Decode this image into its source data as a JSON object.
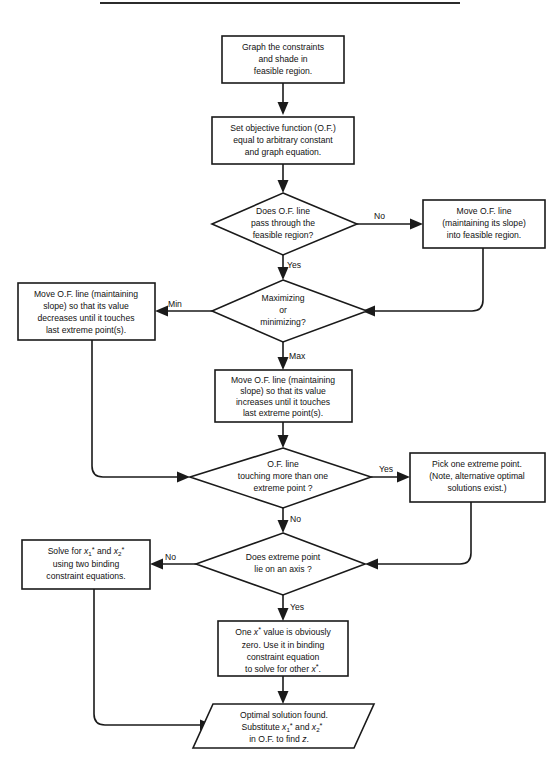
{
  "document": {
    "title": "Graphical Linear Programming Solution Procedure Flowchart",
    "top_rule_visible": true
  },
  "colors": {
    "stroke": "#1a1a1a",
    "text": "#111111",
    "background": "#ffffff",
    "rule": "#2b2b2b"
  },
  "nodes": [
    {
      "id": "graph-constraints",
      "shape": "process",
      "lines": [
        "Graph the constraints",
        "and shade in",
        "feasible region."
      ]
    },
    {
      "id": "set-objective-function",
      "shape": "process",
      "lines": [
        "Set objective function (O.F.)",
        "equal to arbitrary constant",
        "and graph equation."
      ]
    },
    {
      "id": "does-of-line-pass",
      "shape": "decision",
      "lines": [
        "Does  O.F. line",
        "pass through the",
        "feasible region?"
      ]
    },
    {
      "id": "move-of-line-into-feasible",
      "shape": "process",
      "lines": [
        "Move O.F. line",
        "(maintaining its slope)",
        "into feasible region."
      ]
    },
    {
      "id": "maximizing-or-minimizing",
      "shape": "decision",
      "lines": [
        "Maximizing",
        "or",
        "minimizing?"
      ]
    },
    {
      "id": "move-of-line-decreases",
      "shape": "process",
      "lines": [
        "Move O.F. line (maintaining",
        "slope) so that its value",
        "decreases until it touches",
        "last extreme point(s)."
      ]
    },
    {
      "id": "move-of-line-increases",
      "shape": "process",
      "lines": [
        "Move O.F. line (maintaining",
        "slope) so that its value",
        "increases  until it touches",
        "last extreme point(s)."
      ]
    },
    {
      "id": "touching-more-than-one",
      "shape": "decision",
      "lines": [
        "O.F. line",
        "touching more than one",
        "extreme point ?"
      ]
    },
    {
      "id": "pick-one-extreme-point",
      "shape": "process",
      "lines": [
        "Pick one extreme point.",
        "(Note, alternative optimal",
        "solutions exist.)"
      ]
    },
    {
      "id": "extreme-point-on-axis",
      "shape": "decision",
      "lines": [
        "Does extreme point",
        "lie on an axis ?"
      ]
    },
    {
      "id": "solve-for-x1-x2",
      "shape": "process",
      "lines": [
        "Solve for  x1* and x2*",
        "using two binding",
        "constraint equations."
      ]
    },
    {
      "id": "one-x-value-zero",
      "shape": "process",
      "lines": [
        "One x* value is obviously",
        "zero.  Use it in binding",
        "constraint equation",
        "to solve for other  x*."
      ]
    },
    {
      "id": "optimal-solution-found",
      "shape": "parallelogram",
      "lines": [
        "Optimal solution found.",
        "Substitute  x1* and x2*",
        "in O.F. to find z."
      ]
    }
  ],
  "edge_labels": {
    "no_from_pass_through": "No",
    "yes_from_pass_through": "Yes",
    "min_from_maxmin": "Min",
    "max_from_maxmin": "Max",
    "yes_from_touching": "Yes",
    "no_from_touching": "No",
    "no_from_axis": "No",
    "yes_from_axis": "Yes"
  }
}
